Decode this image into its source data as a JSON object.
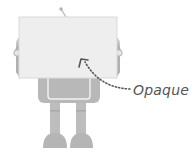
{
  "figure": {
    "annotation": {
      "label": "Opaque",
      "arrow": "dotted-arrow"
    },
    "colors": {
      "robot": "#b5b5b5",
      "board": "#eeeeee",
      "board_border": "#d8d8d8",
      "arrow": "#555555",
      "text": "#555555"
    }
  }
}
